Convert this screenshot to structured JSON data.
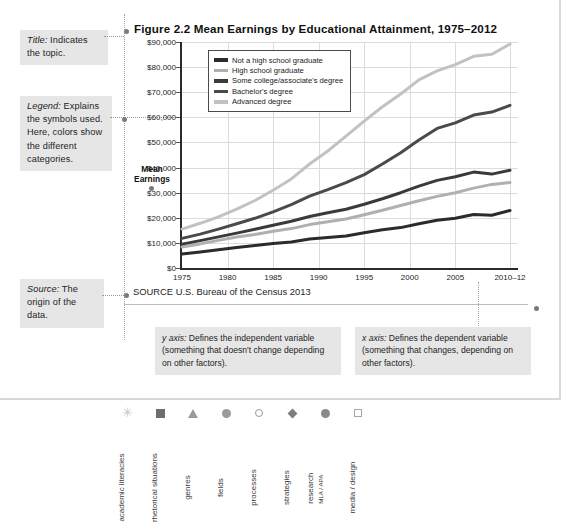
{
  "figure": {
    "title": "Figure 2.2  Mean Earnings by Educational Attainment, 1975–2012",
    "source": "SOURCE  U.S. Bureau of the Census 2013",
    "y_axis_title_line1": "Mean",
    "y_axis_title_line2": "Earnings"
  },
  "annotations": {
    "title": {
      "label": "Title:",
      "text": " Indicates the topic."
    },
    "legend": {
      "label": "Legend:",
      "text": " Explains the symbols used. Here, colors show the different categories."
    },
    "source": {
      "label": "Source:",
      "text": " The origin of the data."
    },
    "y_axis": {
      "label": "y axis:",
      "text": " Defines the independent variable (something that doesn't change depending on other factors)."
    },
    "x_axis": {
      "label": "x axis:",
      "text": " Defines the dependent variable (something that changes, depending on other factors)."
    }
  },
  "chart_data": {
    "type": "line",
    "title": "Mean Earnings by Educational Attainment, 1975–2012",
    "xlabel": "",
    "ylabel": "Mean Earnings",
    "ylim": [
      0,
      90000
    ],
    "grid": true,
    "legend_position": "top-left-inside",
    "y_ticks": [
      "$0",
      "$10,000",
      "$20,000",
      "$30,000",
      "$40,000",
      "$50,000",
      "$60,000",
      "$70,000",
      "$80,000",
      "$90,000"
    ],
    "y_tick_values": [
      0,
      10000,
      20000,
      30000,
      40000,
      50000,
      60000,
      70000,
      80000,
      90000
    ],
    "x_ticks": [
      "1975",
      "1980",
      "1985",
      "1990",
      "1995",
      "2000",
      "2005",
      "2010–12"
    ],
    "x_tick_values": [
      1975,
      1980,
      1985,
      1990,
      1995,
      2000,
      2005,
      2011
    ],
    "x": [
      1975,
      1977,
      1979,
      1981,
      1983,
      1985,
      1987,
      1989,
      1991,
      1993,
      1995,
      1997,
      1999,
      2001,
      2003,
      2005,
      2007,
      2009,
      2011
    ],
    "series": [
      {
        "name": "Not a high school graduate",
        "color": "#2b2b2b",
        "values": [
          5600,
          6400,
          7300,
          8200,
          9000,
          9700,
          10400,
          11500,
          12100,
          12800,
          14000,
          15200,
          16100,
          17600,
          19000,
          19800,
          21300,
          21000,
          22900
        ]
      },
      {
        "name": "High school graduate",
        "color": "#b0b0b0",
        "values": [
          8400,
          9600,
          11000,
          12300,
          13400,
          14600,
          15700,
          17300,
          18400,
          19500,
          21200,
          23000,
          24900,
          26800,
          28500,
          30000,
          31800,
          33300,
          34100
        ]
      },
      {
        "name": "Some college/associate's degree",
        "color": "#3a3a3a",
        "values": [
          9500,
          10900,
          12400,
          13900,
          15400,
          17000,
          18600,
          20500,
          22000,
          23400,
          25400,
          27600,
          30000,
          32600,
          34900,
          36300,
          38200,
          37400,
          38900
        ]
      },
      {
        "name": "Bachelor's degree",
        "color": "#4a4a4a",
        "values": [
          11800,
          13500,
          15500,
          17600,
          19800,
          22400,
          25200,
          28600,
          31200,
          34000,
          37200,
          41400,
          45900,
          51000,
          55600,
          57800,
          60900,
          62100,
          64800
        ]
      },
      {
        "name": "Advanced degree",
        "color": "#c2c2c2",
        "values": [
          15500,
          17800,
          20400,
          23400,
          26900,
          31000,
          35500,
          41400,
          46600,
          52500,
          58500,
          64200,
          69300,
          74900,
          78500,
          81000,
          84300,
          85100,
          89200
        ]
      }
    ]
  },
  "icon_strip": [
    {
      "icon": "asterisk-icon",
      "shape": "star",
      "label": "academic literacies",
      "sub": ""
    },
    {
      "icon": "filled-square-icon",
      "shape": "sq-f",
      "label": "rhetorical situations",
      "sub": ""
    },
    {
      "icon": "filled-triangle-icon",
      "shape": "tri-f",
      "label": "genres",
      "sub": ""
    },
    {
      "icon": "filled-circle-icon",
      "shape": "cir-f",
      "label": "fields",
      "sub": ""
    },
    {
      "icon": "hollow-circle-icon",
      "shape": "cir-o",
      "label": "processes",
      "sub": ""
    },
    {
      "icon": "filled-diamond-icon",
      "shape": "dia-f",
      "label": "strategies",
      "sub": ""
    },
    {
      "icon": "filled-circle-dark-icon",
      "shape": "cir-d",
      "label": "research",
      "sub": "MLA / APA"
    },
    {
      "icon": "hollow-square-icon",
      "shape": "sq-o",
      "label": "media / design",
      "sub": ""
    }
  ]
}
